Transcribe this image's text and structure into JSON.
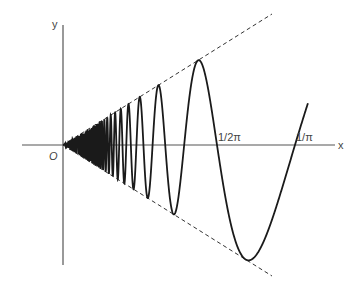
{
  "diagram": {
    "function": "y = x sin(1/x)",
    "axis_labels": {
      "x": "x",
      "y": "y",
      "origin": "O"
    },
    "tick_labels": [
      {
        "label": "1/2π",
        "px": 217
      },
      {
        "label": "1/π",
        "px": 295
      }
    ],
    "envelope": [
      "y = x",
      "y = -x"
    ],
    "colors": {
      "curve": "#1a1a1a",
      "axis": "#555555",
      "dashed": "#333333"
    }
  },
  "chart_data": {
    "type": "line",
    "title": "",
    "xlabel": "x",
    "ylabel": "y",
    "series": [
      {
        "name": "x sin(1/x)",
        "style": "solid"
      },
      {
        "name": "y = x",
        "style": "dashed"
      },
      {
        "name": "y = -x",
        "style": "dashed"
      }
    ],
    "x_ticks": [
      "1/2π",
      "1/π"
    ],
    "grid": false,
    "legend": false
  }
}
